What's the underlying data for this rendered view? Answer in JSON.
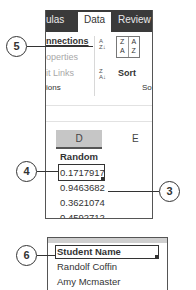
{
  "ribbon": {
    "tabs": [
      {
        "label": "ulas",
        "active": false
      },
      {
        "label": "Data",
        "active": true
      },
      {
        "label": "Review",
        "active": false
      }
    ],
    "connections_group": {
      "items": [
        {
          "label": "nnections",
          "enabled": true
        },
        {
          "label": "operties",
          "enabled": false
        },
        {
          "label": "it Links",
          "enabled": false
        }
      ],
      "group_label": "ions"
    },
    "sort_group": {
      "sort_az_icon": "A↓Z",
      "sort_za_icon": "Z↓A",
      "sort_button_cells": [
        "Z A",
        "A Z"
      ],
      "sort_label": "Sort",
      "group_label": "So"
    }
  },
  "sheet": {
    "columns": [
      "D",
      "E"
    ],
    "selected_column": "D",
    "cells": [
      "Random",
      "0.1717917",
      "0.9463682",
      "0.3621074",
      "0.4592712"
    ]
  },
  "sheet2": {
    "cells": [
      "Student Name",
      "Randolf Coffin",
      "Amy Mcmaster"
    ]
  },
  "callouts": {
    "c5": "5",
    "c4": "4",
    "c3": "3",
    "c6": "6"
  }
}
